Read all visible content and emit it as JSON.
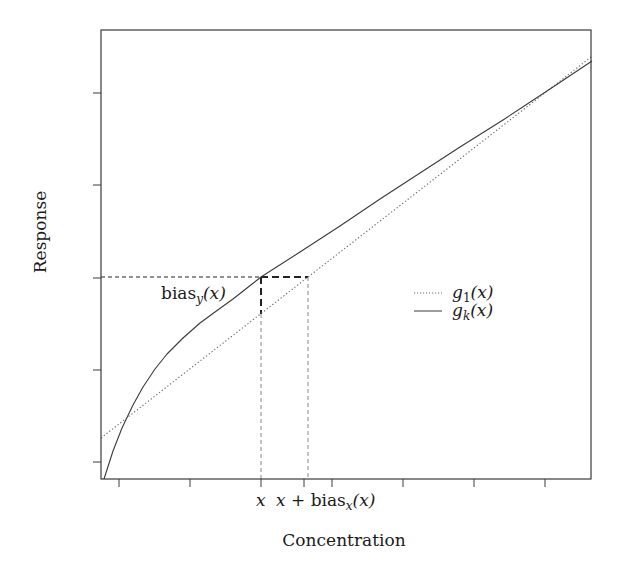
{
  "chart_data": {
    "type": "line",
    "title": "",
    "xlabel": "Concentration",
    "ylabel": "Response",
    "grid": false,
    "legend_position": "right-middle inside plot",
    "x_tick_labels": [
      "",
      "",
      "x",
      "x + bias_x(x)",
      "",
      "",
      "",
      ""
    ],
    "y_tick_labels": [
      "",
      "",
      "",
      "",
      ""
    ],
    "series": [
      {
        "name": "g_1(x)",
        "style": "dotted",
        "description": "straight calibration line",
        "points_px": [
          [
            101,
            438
          ],
          [
            591,
            57
          ]
        ]
      },
      {
        "name": "g_k(x)",
        "style": "solid",
        "description": "concave nonlinear response curve",
        "points_px": [
          [
            104,
            479
          ],
          [
            113,
            451
          ],
          [
            122,
            428
          ],
          [
            133,
            405
          ],
          [
            143,
            387
          ],
          [
            155,
            369
          ],
          [
            167,
            354
          ],
          [
            183,
            338
          ],
          [
            200,
            323
          ],
          [
            215,
            312
          ],
          [
            233,
            299
          ],
          [
            247,
            288
          ],
          [
            261,
            277
          ],
          [
            300,
            252
          ],
          [
            340,
            226
          ],
          [
            380,
            199
          ],
          [
            420,
            173
          ],
          [
            460,
            147
          ],
          [
            503,
            120
          ],
          [
            547,
            91
          ],
          [
            592,
            61
          ]
        ]
      }
    ],
    "annotations": [
      {
        "label": "bias_y(x)",
        "kind": "vertical gap at x between g_k(x) and g_1(x)"
      },
      {
        "label": "x + bias_x(x)",
        "kind": "horizontal gap at response g_k(x) to g_1 inverse"
      }
    ]
  },
  "plot": {
    "frame": {
      "left": 101,
      "top": 30,
      "right": 591,
      "bottom": 479
    },
    "x_ticks_px": [
      119,
      190,
      261,
      304,
      332,
      403,
      474,
      545
    ],
    "y_ticks_px": [
      93,
      185,
      278,
      370,
      462
    ],
    "x_point": 261,
    "x_bias_point": 308,
    "response_level": 277,
    "g1_at_x": 314
  },
  "labels": {
    "ylabel": "Response",
    "xlabel": "Concentration",
    "x_tick": "x",
    "x_bias_tick_prefix": "x + bias",
    "x_bias_tick_sub": "x",
    "x_bias_tick_suffix": "(x)",
    "bias_y_prefix": "bias",
    "bias_y_sub": "y",
    "bias_y_suffix": "(x)"
  },
  "legend": {
    "items": [
      {
        "name_main": "g",
        "name_sub": "1",
        "name_arg": "(x)",
        "style": "dotted"
      },
      {
        "name_main": "g",
        "name_sub": "k",
        "name_arg": "(x)",
        "style": "solid"
      }
    ]
  },
  "colors": {
    "axis": "#3a3a3a",
    "solid_line": "#3a3a3a",
    "dotted_line": "#6a6a6a",
    "guide_dashed": "#8a8a8a",
    "bias_dashed": "#222222"
  }
}
